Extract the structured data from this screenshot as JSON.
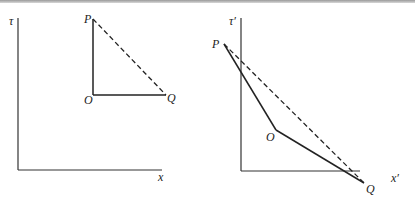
{
  "figure": {
    "left": {
      "axis_y_label": "τ",
      "axis_x_label": "x",
      "points": {
        "P": "P",
        "O": "O",
        "Q": "Q"
      }
    },
    "right": {
      "axis_y_label": "τ′",
      "axis_x_label": "x′",
      "points": {
        "P": "P",
        "O": "O",
        "Q": "Q"
      }
    },
    "colors": {
      "line": "#2a2a2a"
    }
  }
}
